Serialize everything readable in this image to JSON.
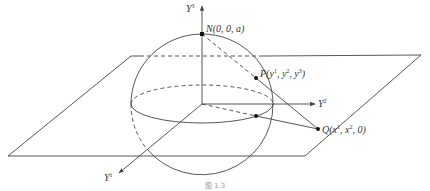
{
  "figure": {
    "type": "stereographic-projection-diagram",
    "axes": {
      "y1": {
        "label": "Y",
        "sup": "1"
      },
      "y2": {
        "label": "Y",
        "sup": "2"
      },
      "y3": {
        "label": "Y",
        "sup": "3"
      }
    },
    "points": {
      "N": {
        "label": "N(0, 0, a)"
      },
      "P": {
        "name": "P",
        "coords_prefix": "(y",
        "c1": "1",
        "sep1": ", y",
        "c2": "2",
        "sep2": ", y",
        "c3": "3",
        "suffix": ")"
      },
      "Q": {
        "name": "Q",
        "coords_prefix": "(x",
        "c1": "1",
        "sep1": ", x",
        "c2": "2",
        "suffix": ", 0)"
      }
    },
    "caption": "图 1.3"
  },
  "colors": {
    "line": "#444444",
    "background": "#ffffff"
  }
}
